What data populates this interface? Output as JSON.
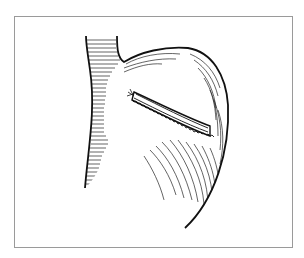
{
  "figure": {
    "frame_color": "#9a9a9a",
    "ink_color": "#111111"
  }
}
